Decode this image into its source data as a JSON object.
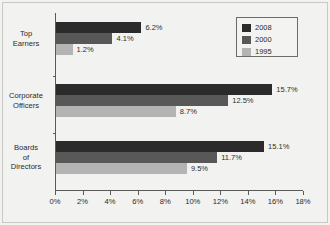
{
  "chart_data": {
    "type": "bar",
    "orientation": "horizontal",
    "title": "",
    "subtitle": "",
    "xlabel": "",
    "ylabel": "",
    "xlim": [
      0,
      18
    ],
    "xtick_values": [
      0,
      2,
      4,
      6,
      8,
      10,
      12,
      14,
      16,
      18
    ],
    "xtick_labels": [
      "0%",
      "2%",
      "4%",
      "6%",
      "8%",
      "10%",
      "12%",
      "14%",
      "16%",
      "18%"
    ],
    "grid": false,
    "legend_position": "top-right",
    "categories": [
      "Top\nEarners",
      "Corporate\nOfficers",
      "Boards\nof\nDirectors"
    ],
    "series": [
      {
        "name": "2008",
        "color": "#2b2b2b",
        "values": [
          6.2,
          15.7,
          15.1
        ],
        "labels": [
          "6.2%",
          "15.7%",
          "15.1%"
        ]
      },
      {
        "name": "2000",
        "color": "#585858",
        "values": [
          4.1,
          12.5,
          11.7
        ],
        "labels": [
          "4.1%",
          "12.5%",
          "11.7%"
        ]
      },
      {
        "name": "1995",
        "color": "#b4b4b4",
        "values": [
          1.2,
          8.7,
          9.5
        ],
        "labels": [
          "1.2%",
          "8.7%",
          "9.5%"
        ]
      }
    ]
  },
  "legend": {
    "entries": [
      {
        "label": "2008",
        "color": "#2b2b2b"
      },
      {
        "label": "2000",
        "color": "#585858"
      },
      {
        "label": "1995",
        "color": "#b4b4b4"
      }
    ]
  },
  "categories": [
    {
      "label": "Top\nEarners"
    },
    {
      "label": "Corporate\nOfficers"
    },
    {
      "label": "Boards\nof\nDirectors"
    }
  ],
  "axis": {
    "x_labels": [
      "0%",
      "2%",
      "4%",
      "6%",
      "8%",
      "10%",
      "12%",
      "14%",
      "16%",
      "18%"
    ]
  },
  "colors": {
    "background": "#f2f2f0",
    "axis": "#5a5a58",
    "text": "#2b2b29",
    "series_2008": "#2b2b2b",
    "series_2000": "#585858",
    "series_1995": "#b4b4b4"
  }
}
